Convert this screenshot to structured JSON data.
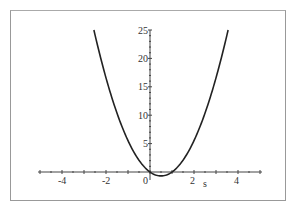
{
  "chart_data": {
    "type": "line",
    "title": "",
    "xlabel": "s",
    "ylabel": "",
    "xlim": [
      -5,
      5
    ],
    "ylim": [
      -0.7,
      25
    ],
    "x_ticks": [
      "-4",
      "-2",
      "0",
      "2",
      "4"
    ],
    "y_ticks": [
      "5",
      "10",
      "15",
      "20",
      "25"
    ],
    "grid": false,
    "series": [
      {
        "name": "f(s)",
        "x": [
          -2.55,
          -2,
          -1.5,
          -1,
          -0.5,
          0,
          0.5,
          1,
          1.5,
          2,
          2.5,
          3,
          3.55
        ],
        "values": [
          25,
          16.2,
          10.1,
          5.4,
          2.0,
          0,
          -0.67,
          0,
          2.0,
          5.4,
          10.1,
          16.2,
          25
        ]
      }
    ],
    "line_color": "#222222"
  }
}
